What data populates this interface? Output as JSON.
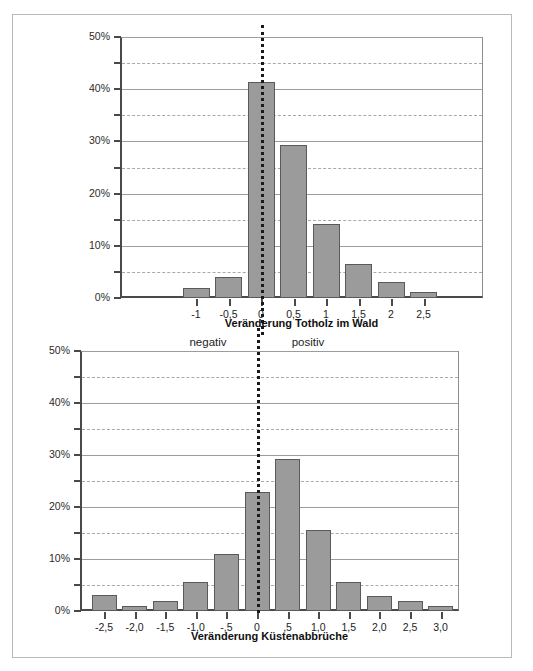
{
  "figure": {
    "between_labels": {
      "negative": "negativ",
      "positive": "positiv"
    },
    "bar_fill_color": "#9b9b9b",
    "bar_border_color": "#5a5a5a",
    "axis_color": "#4a4a4a",
    "gridline_color": "#9c9c9c",
    "zeroline_color": "#1a1a1a"
  },
  "chart_data": [
    {
      "id": "totholz",
      "type": "bar",
      "title": "",
      "xlabel": "Veränderung Totholz im Wald",
      "ylabel": "",
      "ylim": [
        0,
        50
      ],
      "yticks": [
        0,
        10,
        20,
        30,
        40,
        50
      ],
      "ytick_labels": [
        "0%",
        "10%",
        "20%",
        "30%",
        "40%",
        "50%"
      ],
      "yminor": [
        5,
        15,
        25,
        35,
        45
      ],
      "grid": "horizontal major solid + minor dashed",
      "categories": [
        "-1",
        "-0,5",
        "0",
        "0,5",
        "1",
        "1,5",
        "2",
        "2,5"
      ],
      "values": [
        2.0,
        4.0,
        41.3,
        29.3,
        14.2,
        6.6,
        3.0,
        1.2
      ],
      "zero_at_category": "0",
      "annotations": [
        "negativ",
        "positiv"
      ]
    },
    {
      "id": "kuestenabbrueche",
      "type": "bar",
      "title": "",
      "xlabel": "Veränderung Küstenabbrüche",
      "ylabel": "",
      "ylim": [
        0,
        50
      ],
      "yticks": [
        0,
        10,
        20,
        30,
        40,
        50
      ],
      "ytick_labels": [
        "0%",
        "10%",
        "20%",
        "30%",
        "40%",
        "50%"
      ],
      "yminor": [
        5,
        15,
        25,
        35,
        45
      ],
      "grid": "horizontal major solid + minor dashed",
      "categories": [
        "-2,5",
        "-2,0",
        "-1,5",
        "-1,0",
        "-,5",
        "0",
        ",5",
        "1,0",
        "1,5",
        "2,0",
        "2,5",
        "3,0"
      ],
      "values": [
        3.0,
        0.9,
        1.9,
        5.5,
        11.0,
        22.8,
        29.3,
        15.5,
        5.5,
        2.9,
        1.9,
        0.9
      ],
      "zero_at_category": "0",
      "annotations": []
    }
  ]
}
